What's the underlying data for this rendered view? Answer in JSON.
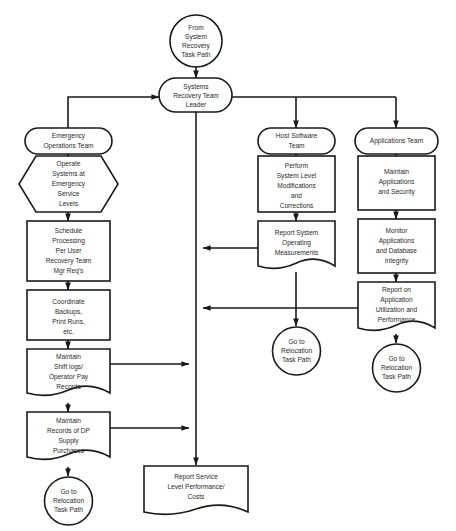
{
  "diagram": {
    "background_color": "#ffffff",
    "line_color": "#1a1a1a",
    "text_color": "#2b2b2b"
  },
  "nodes": {
    "from_system_recovery": {
      "shape": "circle",
      "lines": [
        "From",
        "System",
        "Recovery",
        "Task Path"
      ]
    },
    "systems_recovery_team_leader": {
      "shape": "rounded-terminal",
      "lines": [
        "Systems",
        "Recovery Team",
        "Leader"
      ]
    },
    "emergency_operations_team": {
      "shape": "rounded-terminal",
      "lines": [
        "Emergency",
        "Operations Team"
      ]
    },
    "host_software_team": {
      "shape": "rounded-terminal",
      "lines": [
        "Host Software",
        "Team"
      ]
    },
    "applications_team": {
      "shape": "rounded-terminal",
      "lines": [
        "Applications Team"
      ]
    },
    "operate_systems": {
      "shape": "hexagon-preparation",
      "lines": [
        "Operate",
        "Systems at",
        "Emergency",
        "Service",
        "Levels"
      ]
    },
    "schedule_processing": {
      "shape": "rectangle-process",
      "lines": [
        "Schedule",
        "Processing",
        "Per User",
        "Recovery Team",
        "Mgr Req's"
      ]
    },
    "coordinate_backups": {
      "shape": "rectangle-process",
      "lines": [
        "Coordinate",
        "Backups,",
        "Print Runs,",
        "etc."
      ]
    },
    "maintain_shift_logs": {
      "shape": "document",
      "lines": [
        "Maintain",
        "Shift logs/",
        "Operator Pay",
        "Records"
      ]
    },
    "maintain_records_dp": {
      "shape": "document",
      "lines": [
        "Maintain",
        "Records of DP",
        "Supply",
        "Purchases"
      ]
    },
    "goto_relocation_left": {
      "shape": "circle",
      "lines": [
        "Go to",
        "Relocation",
        "Task Path"
      ]
    },
    "report_service_level": {
      "shape": "document",
      "lines": [
        "Report Service",
        "Level Performance/",
        "Costs"
      ]
    },
    "perform_system_level": {
      "shape": "rectangle-process",
      "lines": [
        "Perform",
        "System Level",
        "Modifications",
        "and",
        "Corrections"
      ]
    },
    "report_system_operating": {
      "shape": "document",
      "lines": [
        "Report System",
        "Operating",
        "Measurements"
      ]
    },
    "goto_relocation_middle": {
      "shape": "circle",
      "lines": [
        "Go to",
        "Relocation",
        "Task Path"
      ]
    },
    "maintain_applications": {
      "shape": "rectangle-process",
      "lines": [
        "Maintain",
        "Applications",
        "and Security"
      ]
    },
    "monitor_applications": {
      "shape": "rectangle-process",
      "lines": [
        "Monitor",
        "Applications",
        "and Database",
        "Integrity"
      ]
    },
    "report_on_application": {
      "shape": "document",
      "lines": [
        "Report on",
        "Application",
        "Utilization and",
        "Performance"
      ]
    },
    "goto_relocation_right": {
      "shape": "circle",
      "lines": [
        "Go to",
        "Relocation",
        "Task Path"
      ]
    }
  }
}
